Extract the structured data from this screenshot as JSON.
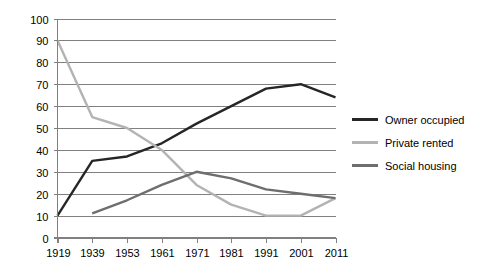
{
  "chart_data": {
    "type": "line",
    "title": "",
    "xlabel": "",
    "ylabel": "",
    "categories": [
      "1919",
      "1939",
      "1953",
      "1961",
      "1971",
      "1981",
      "1991",
      "2001",
      "2011"
    ],
    "ylim": [
      0,
      100
    ],
    "y_ticks": [
      "0",
      "10",
      "20",
      "30",
      "40",
      "50",
      "60",
      "70",
      "80",
      "90",
      "100"
    ],
    "grid": true,
    "legend_position": "right",
    "series": [
      {
        "name": "Owner occupied",
        "color": "#262626",
        "values": [
          10,
          35,
          37,
          43,
          52,
          60,
          68,
          70,
          64
        ]
      },
      {
        "name": "Private rented",
        "color": "#b3b3b3",
        "values": [
          90,
          55,
          50,
          40,
          24,
          15,
          10,
          10,
          18
        ]
      },
      {
        "name": "Social housing",
        "color": "#6e6e6e",
        "values": [
          null,
          11,
          17,
          24,
          30,
          27,
          22,
          20,
          18
        ]
      }
    ]
  },
  "legend": {
    "items": [
      {
        "label": "Owner occupied",
        "color": "#262626",
        "swatch": "legend-swatch-owner-occupied"
      },
      {
        "label": "Private rented",
        "color": "#b3b3b3",
        "swatch": "legend-swatch-private-rented"
      },
      {
        "label": "Social housing",
        "color": "#6e6e6e",
        "swatch": "legend-swatch-social-housing"
      }
    ]
  }
}
